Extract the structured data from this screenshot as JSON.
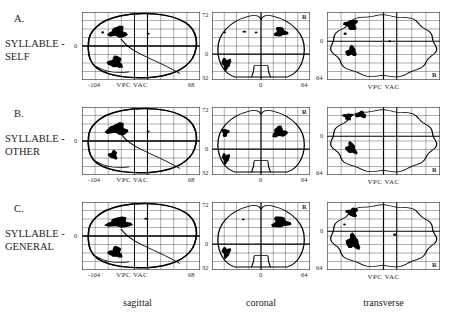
{
  "figure": {
    "type": "glass-brain-spm-projection-grid",
    "rows": [
      {
        "letter": "A.",
        "label_line1": "SYLLABLE -",
        "label_line2": "SELF",
        "panels": {
          "sagittal": {
            "y_top_label": "",
            "y_zero_label": "0",
            "x_left_label": "-104",
            "x_right_label": "68",
            "commissure_label": "VPC  VAC",
            "blobs": [
              {
                "cx": 0.305,
                "cy": 0.3,
                "rx": 0.072,
                "ry": 0.082,
                "kind": "large"
              },
              {
                "cx": 0.285,
                "cy": 0.74,
                "rx": 0.058,
                "ry": 0.085,
                "kind": "large"
              },
              {
                "cx": 0.175,
                "cy": 0.3,
                "rx": 0.012,
                "ry": 0.016,
                "kind": "small"
              },
              {
                "cx": 0.56,
                "cy": 0.32,
                "rx": 0.013,
                "ry": 0.016,
                "kind": "small"
              }
            ]
          },
          "coronal": {
            "y_top_label": "72",
            "y_zero_label": "0",
            "y_bottom_label": "32",
            "x_center_label": "0",
            "x_right_label": "64",
            "hemisphere_marker": "R",
            "blobs": [
              {
                "cx": 0.7,
                "cy": 0.295,
                "rx": 0.062,
                "ry": 0.07,
                "kind": "large"
              },
              {
                "cx": 0.145,
                "cy": 0.76,
                "rx": 0.045,
                "ry": 0.085,
                "kind": "large"
              },
              {
                "cx": 0.33,
                "cy": 0.29,
                "rx": 0.02,
                "ry": 0.012,
                "kind": "small"
              },
              {
                "cx": 0.45,
                "cy": 0.3,
                "rx": 0.014,
                "ry": 0.012,
                "kind": "small"
              },
              {
                "cx": 0.13,
                "cy": 0.3,
                "rx": 0.012,
                "ry": 0.012,
                "kind": "small"
              }
            ]
          },
          "transverse": {
            "y_top_label": "",
            "y_zero_label": "0",
            "y_bottom_label": "64",
            "commissure_label": "VPC  VAC",
            "hemisphere_marker": "R",
            "blobs": [
              {
                "cx": 0.215,
                "cy": 0.185,
                "rx": 0.055,
                "ry": 0.075,
                "kind": "large"
              },
              {
                "cx": 0.215,
                "cy": 0.58,
                "rx": 0.048,
                "ry": 0.07,
                "kind": "large",
                "angle": -35
              },
              {
                "cx": 0.16,
                "cy": 0.32,
                "rx": 0.014,
                "ry": 0.018,
                "kind": "small"
              },
              {
                "cx": 0.555,
                "cy": 0.43,
                "rx": 0.012,
                "ry": 0.014,
                "kind": "small"
              }
            ]
          }
        }
      },
      {
        "letter": "B.",
        "label_line1": "SYLLABLE -",
        "label_line2": "OTHER",
        "panels": {
          "sagittal": {
            "y_zero_label": "0",
            "x_left_label": "-104",
            "x_right_label": "68",
            "commissure_label": "VPC  VAC",
            "blobs": [
              {
                "cx": 0.3,
                "cy": 0.33,
                "rx": 0.088,
                "ry": 0.082,
                "kind": "large"
              },
              {
                "cx": 0.265,
                "cy": 0.705,
                "rx": 0.036,
                "ry": 0.062,
                "kind": "large"
              },
              {
                "cx": 0.56,
                "cy": 0.36,
                "rx": 0.013,
                "ry": 0.016,
                "kind": "small"
              }
            ]
          },
          "coronal": {
            "y_top_label": "72",
            "y_zero_label": "0",
            "y_bottom_label": "32",
            "x_center_label": "0",
            "x_right_label": "64",
            "hemisphere_marker": "R",
            "blobs": [
              {
                "cx": 0.69,
                "cy": 0.37,
                "rx": 0.07,
                "ry": 0.078,
                "kind": "large"
              },
              {
                "cx": 0.135,
                "cy": 0.375,
                "rx": 0.035,
                "ry": 0.06,
                "kind": "large"
              },
              {
                "cx": 0.14,
                "cy": 0.755,
                "rx": 0.038,
                "ry": 0.075,
                "kind": "large"
              }
            ]
          },
          "transverse": {
            "y_zero_label": "0",
            "y_bottom_label": "64",
            "commissure_label": "VPC  VAC",
            "hemisphere_marker": "R",
            "blobs": [
              {
                "cx": 0.185,
                "cy": 0.14,
                "rx": 0.04,
                "ry": 0.05,
                "kind": "large"
              },
              {
                "cx": 0.3,
                "cy": 0.115,
                "rx": 0.048,
                "ry": 0.045,
                "kind": "large"
              },
              {
                "cx": 0.215,
                "cy": 0.61,
                "rx": 0.042,
                "ry": 0.09,
                "kind": "large",
                "angle": -35
              }
            ]
          }
        }
      },
      {
        "letter": "C.",
        "label_line1": "SYLLABLE -",
        "label_line2": "GENERAL",
        "panels": {
          "sagittal": {
            "y_zero_label": "0",
            "x_left_label": "-104",
            "x_right_label": "68",
            "commissure_label": "VPC  VAC",
            "blobs": [
              {
                "cx": 0.315,
                "cy": 0.305,
                "rx": 0.098,
                "ry": 0.075,
                "kind": "large"
              },
              {
                "cx": 0.285,
                "cy": 0.74,
                "rx": 0.055,
                "ry": 0.08,
                "kind": "large"
              },
              {
                "cx": 0.545,
                "cy": 0.245,
                "rx": 0.018,
                "ry": 0.013,
                "kind": "small"
              }
            ]
          },
          "coronal": {
            "y_top_label": "72",
            "y_zero_label": "0",
            "y_bottom_label": "32",
            "x_center_label": "0",
            "x_right_label": "64",
            "hemisphere_marker": "R",
            "blobs": [
              {
                "cx": 0.7,
                "cy": 0.3,
                "rx": 0.085,
                "ry": 0.08,
                "kind": "large"
              },
              {
                "cx": 0.145,
                "cy": 0.74,
                "rx": 0.042,
                "ry": 0.078,
                "kind": "large"
              },
              {
                "cx": 0.32,
                "cy": 0.255,
                "rx": 0.014,
                "ry": 0.014,
                "kind": "small"
              }
            ]
          },
          "transverse": {
            "y_zero_label": "0",
            "y_bottom_label": "64",
            "commissure_label": "VPC  VAC",
            "hemisphere_marker": "R",
            "blobs": [
              {
                "cx": 0.225,
                "cy": 0.15,
                "rx": 0.048,
                "ry": 0.065,
                "kind": "large"
              },
              {
                "cx": 0.23,
                "cy": 0.59,
                "rx": 0.055,
                "ry": 0.11,
                "kind": "large",
                "angle": -30
              },
              {
                "cx": 0.155,
                "cy": 0.33,
                "rx": 0.012,
                "ry": 0.014,
                "kind": "small"
              },
              {
                "cx": 0.6,
                "cy": 0.48,
                "rx": 0.014,
                "ry": 0.018,
                "kind": "small"
              }
            ]
          }
        }
      }
    ],
    "columns": [
      {
        "label": "sagittal"
      },
      {
        "label": "coronal"
      },
      {
        "label": "transverse"
      }
    ],
    "colors": {
      "blob": "#000000",
      "grid": "#4a4a4a",
      "outline": "#000000",
      "text": "#232323",
      "background": "#ffffff"
    }
  }
}
